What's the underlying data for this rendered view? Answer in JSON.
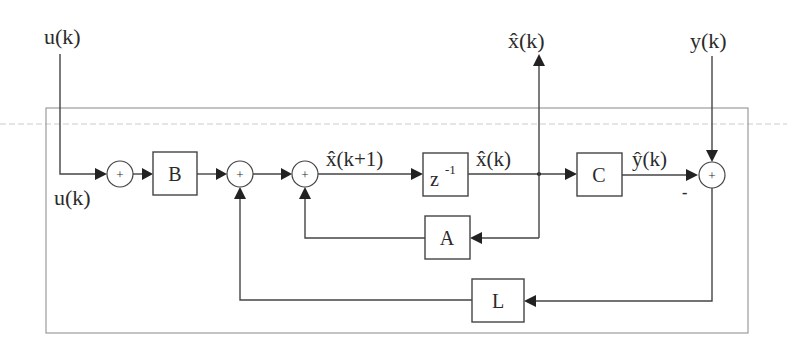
{
  "diagram": {
    "type": "block-diagram",
    "inputs": {
      "u_top": "u(k)",
      "u_inner": "u(k)",
      "y_top": "y(k)"
    },
    "outputs": {
      "x_hat_top": "x̂(k)"
    },
    "blocks": {
      "B": "B",
      "delay": "z",
      "delay_exp": "-1",
      "C": "C",
      "A": "A",
      "L": "L"
    },
    "signals": {
      "x_hat_next": "x̂(k+1)",
      "x_hat": "x̂(k)",
      "y_hat": "ŷ(k)"
    },
    "summing_junctions": {
      "s1": "+",
      "s2": "+",
      "s3": "+",
      "s4": "+",
      "s4_minus_sign": "-"
    }
  },
  "colors": {
    "line": "#444444",
    "frame": "#888888",
    "background": "#ffffff"
  }
}
